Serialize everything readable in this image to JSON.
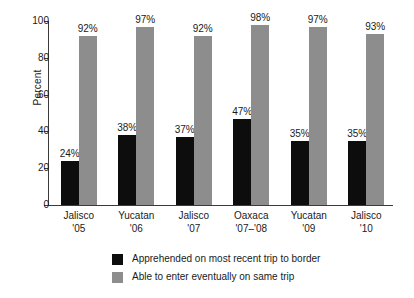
{
  "chart_data": {
    "type": "bar",
    "title": "",
    "subtitle": "",
    "xlabel": "",
    "ylabel": "Percent",
    "ylim": [
      0,
      100
    ],
    "yticks": [
      0,
      20,
      40,
      60,
      80,
      100
    ],
    "ytick_labels": [
      "0",
      "20",
      "40",
      "60",
      "80",
      "100"
    ],
    "grid": false,
    "legend_position": "bottom-center",
    "value_label_suffix": "%",
    "categories": [
      "Jalisco '05",
      "Yucatan '06",
      "Jalisco '07",
      "Oaxaca '07–'08",
      "Yucatan '09",
      "Jalisco '10"
    ],
    "category_lines": [
      {
        "line1": "Jalisco",
        "line2": "'05"
      },
      {
        "line1": "Yucatan",
        "line2": "'06"
      },
      {
        "line1": "Jalisco",
        "line2": "'07"
      },
      {
        "line1": "Oaxaca",
        "line2": "'07–'08"
      },
      {
        "line1": "Yucatan",
        "line2": "'09"
      },
      {
        "line1": "Jalisco",
        "line2": "'10"
      }
    ],
    "series": [
      {
        "name": "Apprehended on most recent trip to border",
        "color": "#0d0d0d",
        "values": [
          24,
          38,
          37,
          47,
          35,
          35
        ],
        "value_labels": [
          "24%",
          "38%",
          "37%",
          "47%",
          "35%",
          "35%"
        ]
      },
      {
        "name": "Able to enter eventually on same trip",
        "color": "#8d8d8d",
        "values": [
          92,
          97,
          92,
          98,
          97,
          93
        ],
        "value_labels": [
          "92%",
          "97%",
          "92%",
          "98%",
          "97%",
          "93%"
        ]
      }
    ],
    "legend": [
      {
        "label": "Apprehended on most recent trip to border",
        "color": "#0d0d0d"
      },
      {
        "label": "Able to enter eventually on same trip",
        "color": "#8d8d8d"
      }
    ]
  }
}
